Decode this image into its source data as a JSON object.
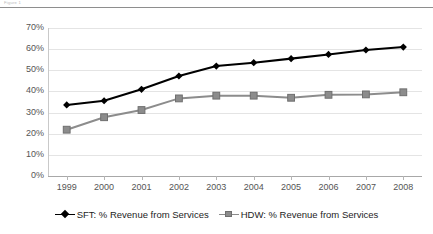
{
  "figure": {
    "caption": "Figure 1"
  },
  "chart_data": {
    "type": "line",
    "title": "",
    "subtitle": "",
    "xlabel": "",
    "ylabel": "",
    "categories": [
      "1999",
      "2000",
      "2001",
      "2002",
      "2003",
      "2004",
      "2005",
      "2006",
      "2007",
      "2008"
    ],
    "ylim": [
      0,
      70
    ],
    "ytick_values": [
      0,
      10,
      20,
      30,
      40,
      50,
      60,
      70
    ],
    "ytick_labels": [
      "0%",
      "10%",
      "20%",
      "30%",
      "40%",
      "50%",
      "60%",
      "70%"
    ],
    "grid": true,
    "legend_position": "bottom",
    "series": [
      {
        "name": "SFT: % Revenue from Services",
        "color": "#000000",
        "marker": "diamond",
        "values": [
          33.6,
          35.6,
          41.0,
          47.3,
          52.0,
          53.6,
          55.5,
          57.5,
          59.6,
          61.0
        ]
      },
      {
        "name": "HDW: % Revenue from Services",
        "color": "#8c8c8c",
        "marker": "square",
        "values": [
          21.9,
          27.8,
          31.2,
          36.7,
          38.0,
          38.0,
          37.0,
          38.4,
          38.6,
          39.6
        ]
      }
    ]
  },
  "legend": {
    "entries": [
      {
        "label": "SFT: % Revenue from Services",
        "marker": "diamond-marker",
        "color": "#000000"
      },
      {
        "label": "HDW: % Revenue from Services",
        "marker": "square-marker",
        "color": "#8c8c8c"
      }
    ]
  }
}
